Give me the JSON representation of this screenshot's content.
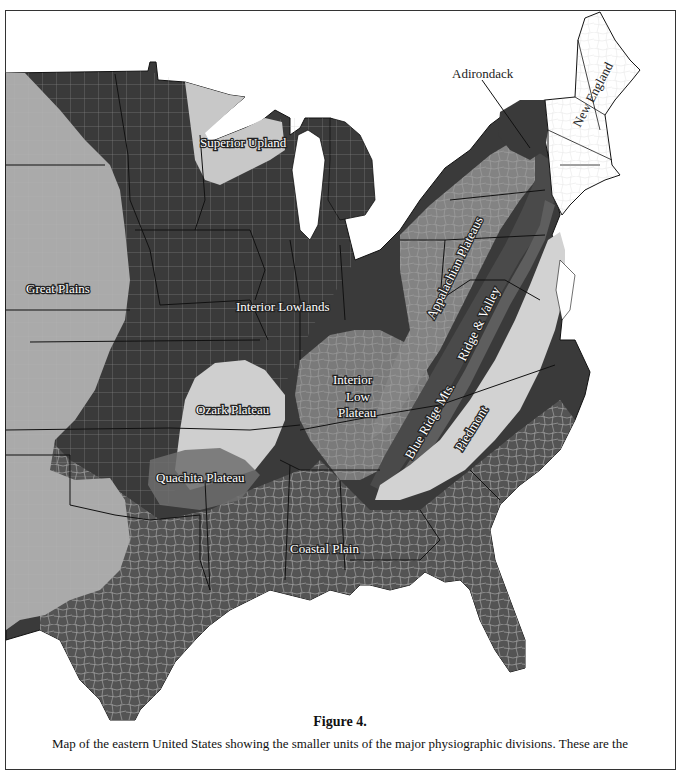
{
  "figure": {
    "title": "Figure 4.",
    "caption": "Map of the eastern United States showing the smaller units of the major physiographic divisions. These are the"
  },
  "map": {
    "region": "Eastern United States",
    "colors": {
      "interior_lowlands": "#3a3a3a",
      "coastal_plain": "#545454",
      "great_plains": "#aaaaaa",
      "superior_upland": "#c8c8c8",
      "ozark_plateau": "#cfcfcf",
      "interior_low_plateau": "#7a7a7a",
      "appalachian_plateaus": "#838383",
      "ridge_valley": "#4a4a4a",
      "blue_ridge": "#5e5e5e",
      "piedmont": "#d2d2d2",
      "new_england": "#ffffff",
      "adirondack": "#3a3a3a",
      "county_lines": "#bbbbbb",
      "state_lines": "#111111"
    },
    "labels": {
      "superior_upland": "Superior Upland",
      "adirondack": "Adirondack",
      "new_england": "New England",
      "great_plains": "Great Plains",
      "interior_lowlands": "Interior  Lowlands",
      "appalachian_plateaus": "Appalachian Plateaus",
      "ridge_valley": "Ridge & Valley",
      "interior_low_plateau_1": "Interior",
      "interior_low_plateau_2": "Low",
      "interior_low_plateau_3": "Plateau",
      "ozark_plateau": "Ozark Plateau",
      "blue_ridge": "Blue Ridge Mts.",
      "piedmont": "Piedmont",
      "quachita_plateau": "Quachita Plateau",
      "coastal_plain": "Coastal  Plain"
    }
  }
}
